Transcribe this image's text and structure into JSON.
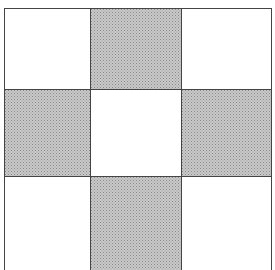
{
  "pattern": {
    "description": "3x3 checker grid",
    "rows": 3,
    "cols": 3,
    "cells": [
      [
        "white",
        "shaded",
        "white"
      ],
      [
        "shaded",
        "white",
        "shaded"
      ],
      [
        "white",
        "shaded",
        "white"
      ]
    ],
    "colors": {
      "line": "#444444",
      "shaded": "#c9c9c9",
      "white": "#ffffff"
    }
  }
}
